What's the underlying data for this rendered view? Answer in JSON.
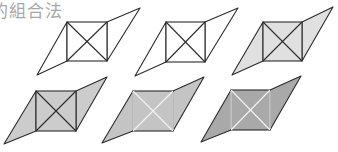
{
  "title": "的組合法",
  "colors": {
    "outline": "#2b2b2b",
    "white_line": "#f4f4f4",
    "light_fill": "#e0e0e0",
    "mid_fill": "#cccccc",
    "fig5_fill": "#c4c4c4",
    "fig6_fill": "#a9a9a9"
  },
  "figures": [
    {
      "id": 1,
      "square": [
        67,
        22,
        107,
        61
      ],
      "left_tip": [
        37,
        75
      ],
      "right_tip": [
        140,
        8
      ],
      "square_fill": "none",
      "left_fill": "none",
      "right_fill": "none",
      "inner_line": "dark"
    },
    {
      "id": 2,
      "square": [
        166,
        22,
        205,
        62
      ],
      "left_tip": [
        135,
        76
      ],
      "right_tip": [
        238,
        8
      ],
      "square_fill": "none",
      "left_fill": "none",
      "right_fill": "none",
      "inner_line": "dark"
    },
    {
      "id": 3,
      "square": [
        263,
        22,
        302,
        61
      ],
      "left_tip": [
        232,
        75
      ],
      "right_tip": [
        333,
        7
      ],
      "square_fill": "light",
      "left_fill": "light",
      "right_fill": "light",
      "inner_line": "dark"
    },
    {
      "id": 4,
      "square": [
        36,
        91,
        76,
        131
      ],
      "left_tip": [
        4,
        144
      ],
      "right_tip": [
        107,
        77
      ],
      "square_fill": "mid",
      "left_fill": "mid",
      "right_fill": "mid",
      "inner_line": "dark"
    },
    {
      "id": 5,
      "square": [
        133,
        91,
        173,
        131
      ],
      "left_tip": [
        102,
        143
      ],
      "right_tip": [
        204,
        77
      ],
      "square_fill": "fig5",
      "left_fill": "fig5",
      "right_fill": "fig5",
      "inner_line": "white"
    },
    {
      "id": 6,
      "square": [
        231,
        90,
        270,
        130
      ],
      "left_tip": [
        201,
        142
      ],
      "right_tip": [
        301,
        76
      ],
      "square_fill": "fig6",
      "left_fill": "fig6",
      "right_fill": "fig6",
      "inner_line": "white"
    }
  ]
}
